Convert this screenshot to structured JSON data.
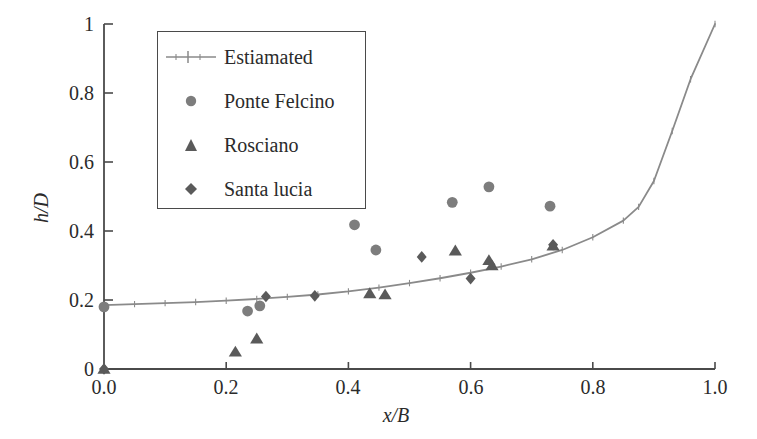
{
  "chart_data": {
    "type": "scatter",
    "title": "",
    "xlabel": "x/B",
    "ylabel": "h/D",
    "xlim": [
      0.0,
      1.0
    ],
    "ylim": [
      0.0,
      1.0
    ],
    "xticks": [
      "0.0",
      "0.2",
      "0.4",
      "0.6",
      "0.8",
      "1.0"
    ],
    "xtick_values": [
      0.0,
      0.2,
      0.4,
      0.6,
      0.8,
      1.0
    ],
    "yticks": [
      "0",
      "0.2",
      "0.4",
      "0.6",
      "0.8",
      "1"
    ],
    "ytick_values": [
      0.0,
      0.2,
      0.4,
      0.6,
      0.8,
      1.0
    ],
    "grid": false,
    "legend_position": "upper-left-inside",
    "series": [
      {
        "name": "Estiamated",
        "marker": "line-with-plus-markers",
        "color": "#8a8a8a",
        "type": "line",
        "x": [
          0.0,
          0.05,
          0.1,
          0.15,
          0.2,
          0.25,
          0.3,
          0.35,
          0.4,
          0.45,
          0.5,
          0.55,
          0.6,
          0.65,
          0.7,
          0.75,
          0.8,
          0.85,
          0.875,
          0.9,
          0.93,
          0.96,
          1.0
        ],
        "y": [
          0.185,
          0.188,
          0.191,
          0.194,
          0.198,
          0.203,
          0.209,
          0.216,
          0.225,
          0.236,
          0.249,
          0.263,
          0.279,
          0.297,
          0.318,
          0.345,
          0.382,
          0.43,
          0.47,
          0.545,
          0.69,
          0.84,
          1.0
        ]
      },
      {
        "name": "Ponte Felcino",
        "marker": "circle",
        "color": "#7d7d7d",
        "type": "scatter",
        "x": [
          0.0,
          0.235,
          0.255,
          0.41,
          0.445,
          0.57,
          0.63,
          0.73
        ],
        "y": [
          0.18,
          0.168,
          0.183,
          0.418,
          0.345,
          0.483,
          0.528,
          0.472
        ]
      },
      {
        "name": "Rosciano",
        "marker": "triangle",
        "color": "#5a5a5a",
        "type": "scatter",
        "x": [
          0.0,
          0.215,
          0.25,
          0.435,
          0.46,
          0.575,
          0.63,
          0.635,
          0.735
        ],
        "y": [
          0.0,
          0.05,
          0.088,
          0.219,
          0.216,
          0.343,
          0.315,
          0.3,
          0.357
        ]
      },
      {
        "name": "Santa lucia",
        "marker": "diamond",
        "color": "#5a5a5a",
        "type": "scatter",
        "x": [
          0.0,
          0.265,
          0.345,
          0.52,
          0.6,
          0.735
        ],
        "y": [
          0.0,
          0.21,
          0.212,
          0.325,
          0.262,
          0.36
        ]
      }
    ]
  },
  "legend": {
    "items": [
      {
        "label": "Estiamated",
        "marker": "line-with-plus-markers"
      },
      {
        "label": "Ponte Felcino",
        "marker": "circle"
      },
      {
        "label": "Rosciano",
        "marker": "triangle"
      },
      {
        "label": "Santa lucia",
        "marker": "diamond"
      }
    ]
  },
  "colors": {
    "axis": "#4a4a4a",
    "line": "#8a8a8a",
    "circle": "#7d7d7d",
    "triangle": "#5a5a5a",
    "diamond": "#5a5a5a",
    "text": "#2b2b2b",
    "background": "#ffffff"
  }
}
